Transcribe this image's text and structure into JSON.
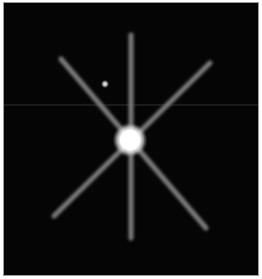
{
  "image": {
    "description": "Simulated point-source image: bright star with six diffraction spikes and a faint companion",
    "background_color": "#050505",
    "border_color": "#9a9a9a",
    "main_star": {
      "cx": 130,
      "cy": 140,
      "r": 13,
      "color": "#ffffff"
    },
    "companion_star": {
      "cx": 105,
      "cy": 84,
      "r": 3,
      "color": "#e8e8e8"
    },
    "spikes": [
      {
        "x1": 131,
        "y1": 35,
        "x2": 131,
        "y2": 238
      },
      {
        "x1": 61,
        "y1": 59,
        "x2": 206,
        "y2": 228
      },
      {
        "x1": 210,
        "y1": 63,
        "x2": 54,
        "y2": 216
      }
    ],
    "spike_color": "#7a7a7a",
    "scan_line_y": 105
  }
}
